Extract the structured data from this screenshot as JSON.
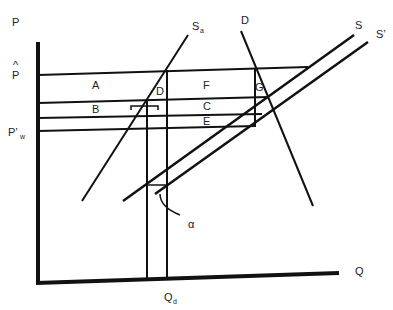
{
  "diagram": {
    "type": "supply-demand-tariff",
    "axes": {
      "y_label": "P",
      "x_label": "Q"
    },
    "price_labels": {
      "p_hat": "P",
      "p_hat_accent": "^",
      "p_world": "P’",
      "p_world_sub": "w"
    },
    "quantity_labels": {
      "q": "Q",
      "q_sub": "d"
    },
    "curves": {
      "s_a": "S",
      "s_a_sub": "a",
      "demand": "D",
      "supply": "S",
      "supply_shifted": "S’"
    },
    "regions": {
      "A": "A",
      "B": "B",
      "C": "C",
      "D": "D",
      "E": "E",
      "F": "F",
      "G": "G"
    },
    "annotation": "α",
    "colors": {
      "line": "#111111",
      "background": "#ffffff"
    }
  }
}
